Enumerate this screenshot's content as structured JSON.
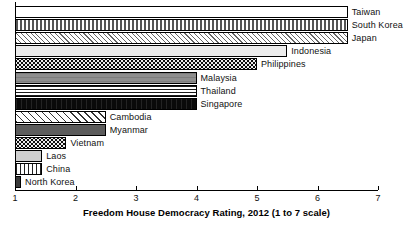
{
  "chart_data": {
    "type": "bar",
    "orientation": "horizontal",
    "title": "",
    "subtitle": "",
    "xlabel": "Freedom House Democracy Rating, 2012 (1 to 7 scale)",
    "ylabel": "",
    "xlim": [
      1,
      7
    ],
    "xticks": [
      1,
      2,
      3,
      4,
      5,
      6,
      7
    ],
    "xticklabels": [
      "1",
      "2",
      "3",
      "4",
      "5",
      "6",
      "7"
    ],
    "grid": false,
    "legend": "none",
    "legend_position": "none",
    "label_placement": "right-of-bar",
    "categories": [
      "Taiwan",
      "South Korea",
      "Japan",
      "Indonesia",
      "Philippines",
      "Malaysia",
      "Thailand",
      "Singapore",
      "Cambodia",
      "Myanmar",
      "Vietnam",
      "Laos",
      "China",
      "North Korea"
    ],
    "values": [
      6.5,
      6.5,
      6.5,
      5.5,
      5.0,
      4.0,
      4.0,
      4.0,
      2.5,
      2.5,
      1.85,
      1.45,
      1.45,
      1.1
    ],
    "bars": [
      {
        "label": "Taiwan",
        "value": 6.5,
        "pattern": "dots-sparse"
      },
      {
        "label": "South Korea",
        "value": 6.5,
        "pattern": "dashed-rows"
      },
      {
        "label": "Japan",
        "value": 6.5,
        "pattern": "diagonal-hatch-thin"
      },
      {
        "label": "Indonesia",
        "value": 5.5,
        "pattern": "light-gray"
      },
      {
        "label": "Philippines",
        "value": 5.0,
        "pattern": "black-with-white-dots"
      },
      {
        "label": "Malaysia",
        "value": 4.0,
        "pattern": "mid-gray"
      },
      {
        "label": "Thailand",
        "value": 4.0,
        "pattern": "horizontal-lines"
      },
      {
        "label": "Singapore",
        "value": 4.0,
        "pattern": "solid-black"
      },
      {
        "label": "Cambodia",
        "value": 2.5,
        "pattern": "diagonal-hatch-wide"
      },
      {
        "label": "Myanmar",
        "value": 2.5,
        "pattern": "dark-gray"
      },
      {
        "label": "Vietnam",
        "value": 1.85,
        "pattern": "black-with-white-dots"
      },
      {
        "label": "Laos",
        "value": 1.45,
        "pattern": "pale-gray"
      },
      {
        "label": "China",
        "value": 1.45,
        "pattern": "vertical-lines"
      },
      {
        "label": "North Korea",
        "value": 1.1,
        "pattern": "charcoal"
      }
    ]
  }
}
